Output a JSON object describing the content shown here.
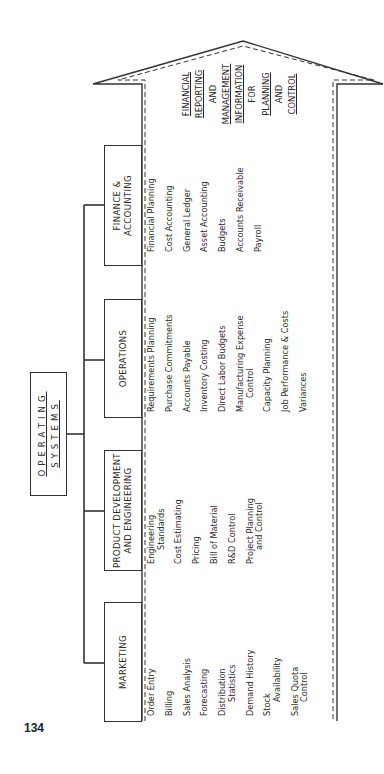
{
  "page_number": "134",
  "root": {
    "title_line1": "OPERATING",
    "title_line2": "SYSTEMS"
  },
  "departments": [
    {
      "name": "MARKETING",
      "items": [
        "Order Entry",
        "Billing",
        "Sales Analysis",
        "Forecasting",
        "Distribution|Statistics",
        "Demand History",
        "Stock|Availability",
        "Sales Quota|Control"
      ]
    },
    {
      "name_line1": "PRODUCT DEVELOPMENT",
      "name_line2": "AND ENGINEERING",
      "items": [
        "Engineering|Standards",
        "Cost Estimating",
        "Pricing",
        "Bill of Material",
        "R&D Control",
        "Project Planning|and Control"
      ]
    },
    {
      "name": "OPERATIONS",
      "items": [
        "Requirements Planning",
        "Purchase Commitments",
        "Accounts Payable",
        "Inventory Costing",
        "Direct Labor Budgets",
        "Manufacturing Expense|Control",
        "Capacity Planning",
        "Job Performance & Costs",
        "Variances"
      ]
    },
    {
      "name_line1": "FINANCE &",
      "name_line2": "ACCOUNTING",
      "items": [
        "Financial Planning",
        "Cost Accounting",
        "General Ledger",
        "Asset Accounting",
        "Budgets",
        "Accounts Receivable",
        "Payroll"
      ]
    }
  ],
  "arrow_label": [
    {
      "text": "FINANCIAL",
      "underline": true
    },
    {
      "text": "REPORTING",
      "underline": true
    },
    {
      "text": "AND",
      "underline": false
    },
    {
      "text": "MANAGEMENT",
      "underline": true
    },
    {
      "text": "INFORMATION",
      "underline": true
    },
    {
      "text": "FOR",
      "underline": false
    },
    {
      "text": "PLANNING",
      "underline": true
    },
    {
      "text": "AND",
      "underline": false
    },
    {
      "text": "CONTROL",
      "underline": true
    }
  ],
  "colors": {
    "ink": "#333333",
    "background": "#ffffff"
  }
}
